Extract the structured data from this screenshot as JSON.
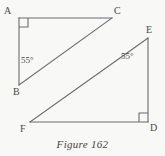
{
  "figure": {
    "caption": "Figure 162",
    "background_color": "#f8f8f6",
    "stroke_color": "#6b6b70",
    "text_color": "#4a4a4a",
    "width": 165,
    "height": 156,
    "triangles": [
      {
        "name": "triangle-ABC",
        "vertices": [
          {
            "label": "A",
            "x": 19,
            "y": 18,
            "angle_marker": "right-angle"
          },
          {
            "label": "C",
            "x": 112,
            "y": 18,
            "angle_marker": "none"
          },
          {
            "label": "B",
            "x": 19,
            "y": 85,
            "angle_marker": "none"
          }
        ],
        "edges": [
          {
            "from": "A",
            "to": "C"
          },
          {
            "from": "A",
            "to": "B"
          },
          {
            "from": "B",
            "to": "C"
          }
        ],
        "angles": [
          {
            "at": "A",
            "value": "90",
            "marker": "square"
          },
          {
            "at": "B",
            "value": "55",
            "label": "55°"
          }
        ]
      },
      {
        "name": "triangle-DEF",
        "vertices": [
          {
            "label": "E",
            "x": 148,
            "y": 38,
            "angle_marker": "none"
          },
          {
            "label": "D",
            "x": 148,
            "y": 122,
            "angle_marker": "right-angle"
          },
          {
            "label": "F",
            "x": 30,
            "y": 122,
            "angle_marker": "none"
          }
        ],
        "edges": [
          {
            "from": "E",
            "to": "D"
          },
          {
            "from": "D",
            "to": "F"
          },
          {
            "from": "F",
            "to": "E"
          }
        ],
        "angles": [
          {
            "at": "D",
            "value": "90",
            "marker": "square"
          },
          {
            "at": "E",
            "value": "55",
            "label": "55°"
          }
        ]
      }
    ],
    "vertex_labels": {
      "A": "A",
      "B": "B",
      "C": "C",
      "D": "D",
      "E": "E",
      "F": "F"
    },
    "angle_labels": {
      "angle_B": "55°",
      "angle_E": "55°"
    }
  }
}
